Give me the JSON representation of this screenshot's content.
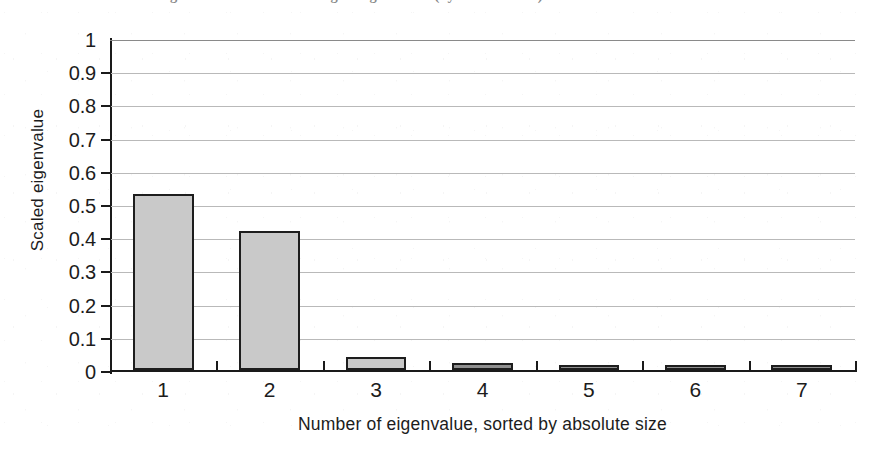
{
  "figure": {
    "caption_visible_sliver": "FIGURE 11.10   Scaled eigenvalues of the seven largest eigenvalues (by absolute size)"
  },
  "chart_data": {
    "type": "bar",
    "title": "",
    "subtitle": "",
    "xlabel": "Number of eigenvalue, sorted by absolute size",
    "ylabel": "Scaled eigenvalue",
    "categories": [
      "1",
      "2",
      "3",
      "4",
      "5",
      "6",
      "7"
    ],
    "values": [
      0.53,
      0.42,
      0.04,
      0.02,
      0.012,
      0.01,
      0.012
    ],
    "ylim": [
      0,
      1
    ],
    "ytick_labels": [
      "0",
      "0.1",
      "0.2",
      "0.3",
      "0.4",
      "0.5",
      "0.6",
      "0.7",
      "0.8",
      "0.9",
      "1"
    ],
    "ytick_values": [
      0,
      0.1,
      0.2,
      0.3,
      0.4,
      0.5,
      0.6,
      0.7,
      0.8,
      0.9,
      1
    ],
    "grid": true,
    "grid_axis": "y",
    "legend": null,
    "bar_fill_color": "#c9c9c9",
    "bar_edge_color": "#1d1d1d",
    "grid_color": "#b9b9b9",
    "axis_color": "#1a1a1a",
    "background_color": "#ffffff"
  }
}
